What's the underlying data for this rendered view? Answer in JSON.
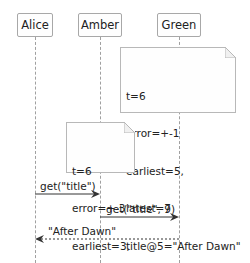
{
  "participants": [
    {
      "name": "Alice",
      "x": 35
    },
    {
      "name": "Amber",
      "x": 100
    },
    {
      "name": "Green",
      "x": 179
    }
  ],
  "notes": [
    {
      "anchor": "Green",
      "lines": [
        "t=6",
        "error=+-1",
        "earliest=5,",
        "latest=7",
        "title@5=\"After Dawn\""
      ]
    },
    {
      "anchor": "Amber",
      "lines": [
        "t=6",
        "error=+-3",
        "earliest=3,",
        "latest=9"
      ]
    }
  ],
  "messages": [
    {
      "from": "Alice",
      "to": "Amber",
      "label": "get(\"title\")",
      "style": "solid"
    },
    {
      "from": "Amber",
      "to": "Green",
      "label": "get(\"title\", 9)",
      "style": "solid"
    },
    {
      "from": "Green",
      "to": "Alice",
      "label": "\"After Dawn\"",
      "style": "dashed"
    }
  ],
  "colors": {
    "border": "#a8a8a8",
    "lifeline": "#a0a0a0",
    "arrow": "#333333",
    "background": "#fefefe"
  }
}
